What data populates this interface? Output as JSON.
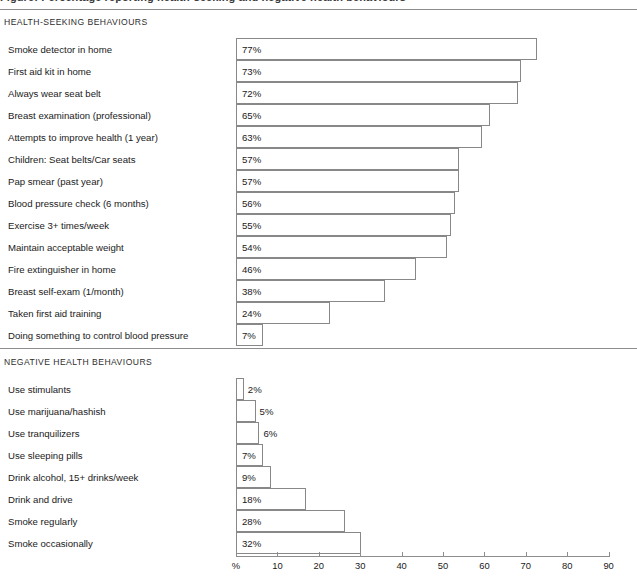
{
  "figure": {
    "cut_off_title": "Figure: Percentage reporting health-seeking and negative health behaviours",
    "axis_unit_label": "%"
  },
  "sections": [
    {
      "id": "health-seeking",
      "heading": "HEALTH-SEEKING BEHAVIOURS"
    },
    {
      "id": "negative-health",
      "heading": "NEGATIVE HEALTH BEHAVIOURS"
    }
  ],
  "axis": {
    "ticks": [
      {
        "label": "%",
        "value": 0
      },
      {
        "label": "10",
        "value": 10
      },
      {
        "label": "20",
        "value": 20
      },
      {
        "label": "30",
        "value": 30
      },
      {
        "label": "40",
        "value": 40
      },
      {
        "label": "50",
        "value": 50
      },
      {
        "label": "60",
        "value": 60
      },
      {
        "label": "70",
        "value": 70
      },
      {
        "label": "80",
        "value": 80
      },
      {
        "label": "90",
        "value": 90
      }
    ]
  },
  "chart_data": {
    "type": "bar",
    "title": "Figure: Percentage reporting health-seeking and negative health behaviours",
    "xlabel": "%",
    "ylabel": "",
    "xlim": [
      0,
      90
    ],
    "grid": false,
    "legend": null,
    "orientation": "horizontal",
    "groups": [
      {
        "name": "HEALTH-SEEKING BEHAVIOURS",
        "categories": [
          "Smoke detector in home",
          "First aid kit in home",
          "Always wear seat belt",
          "Breast examination (professional)",
          "Attempts to improve health (1 year)",
          "Children: Seat belts/Car seats",
          "Pap smear (past year)",
          "Blood pressure check (6 months)",
          "Exercise 3+ times/week",
          "Maintain acceptable weight",
          "Fire extinguisher in home",
          "Breast self-exam (1/month)",
          "Taken first aid training",
          "Doing something to control blood pressure"
        ],
        "values": [
          77,
          73,
          72,
          65,
          63,
          57,
          57,
          56,
          55,
          54,
          46,
          38,
          24,
          7
        ],
        "value_labels": [
          "77%",
          "73%",
          "72%",
          "65%",
          "63%",
          "57%",
          "57%",
          "56%",
          "55%",
          "54%",
          "46%",
          "38%",
          "24%",
          "7%"
        ]
      },
      {
        "name": "NEGATIVE HEALTH BEHAVIOURS",
        "categories": [
          "Use stimulants",
          "Use marijuana/hashish",
          "Use tranquilizers",
          "Use sleeping pills",
          "Drink alcohol, 15+ drinks/week",
          "Drink and drive",
          "Smoke regularly",
          "Smoke occasionally"
        ],
        "values": [
          2,
          5,
          6,
          7,
          9,
          18,
          28,
          32
        ],
        "value_labels": [
          "2%",
          "5%",
          "6%",
          "7%",
          "9%",
          "18%",
          "28%",
          "32%"
        ]
      }
    ]
  },
  "colors": {
    "bar_fill": "#ffffff",
    "bar_stroke": "#888888",
    "rule": "#8d8d8d",
    "text": "#1a1a1a",
    "background": "#ffffff"
  }
}
